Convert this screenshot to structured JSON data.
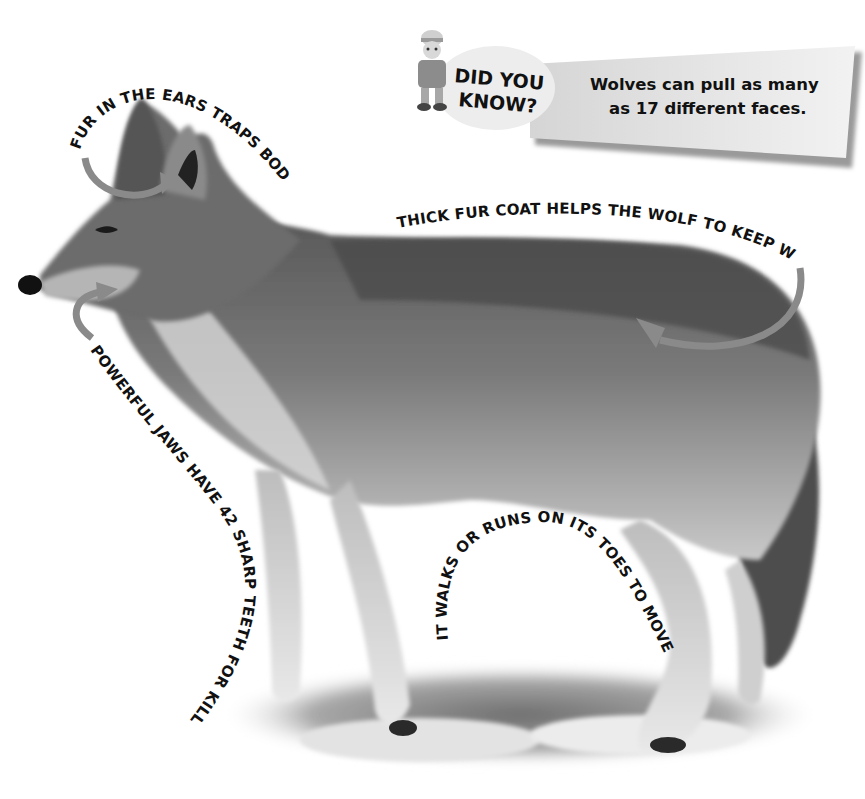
{
  "callout": {
    "title_line1": "DID YOU",
    "title_line2": "KNOW?",
    "body_line1": "Wolves can pull as many",
    "body_line2": "as 17 different faces.",
    "mascot": "explorer-mascot-icon"
  },
  "labels": {
    "ears": "FUR IN THE EARS TRAPS BODY HEAT",
    "coat": "THICK FUR COAT HELPS THE WOLF TO KEEP WARM.",
    "jaws": "POWERFUL JAWS HAVE 42 SHARP TEETH FOR KILLING PREY.",
    "toes": "IT WALKS OR RUNS ON ITS TOES TO MOVE FASTER."
  },
  "colors": {
    "arrow": "#8a8a8a",
    "text": "#111111",
    "background": "#ffffff",
    "banner": "#e6e6e6"
  }
}
